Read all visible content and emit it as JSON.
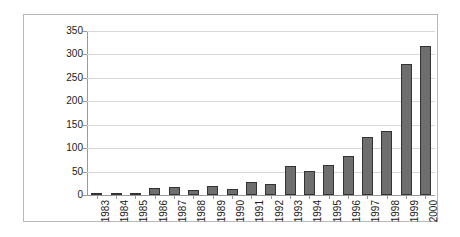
{
  "chart_data": {
    "type": "bar",
    "title": "",
    "subtitle": "",
    "xlabel": "",
    "ylabel": "",
    "categories": [
      "1983",
      "1984",
      "1985",
      "1986",
      "1987",
      "1988",
      "1989",
      "1990",
      "1991",
      "1992",
      "1993",
      "1994",
      "1995",
      "1996",
      "1997",
      "1998",
      "1999",
      "2000"
    ],
    "values": [
      1,
      2,
      4,
      16,
      18,
      10,
      20,
      12,
      27,
      24,
      62,
      52,
      63,
      84,
      124,
      137,
      280,
      317
    ],
    "series": [
      {
        "name": "",
        "values": [
          1,
          2,
          4,
          16,
          18,
          10,
          20,
          12,
          27,
          24,
          62,
          52,
          63,
          84,
          124,
          137,
          280,
          317
        ]
      }
    ],
    "ylim": [
      0,
      350
    ],
    "y_ticks": [
      0,
      50,
      100,
      150,
      200,
      250,
      300,
      350
    ],
    "y_tick_labels": [
      "0",
      "50",
      "100",
      "150",
      "200",
      "250",
      "300",
      "350"
    ],
    "grid": true,
    "grid_axis": "y",
    "legend": false,
    "legend_position": "none",
    "x_tick_rotation": 90,
    "bar_color": "#6e6e6e",
    "bar_border_color": "#333333",
    "grid_color": "#d8d8d8",
    "axis_color": "#9a9a9a",
    "frame_color": "#b9b9b9",
    "background_color": "#ffffff",
    "annotations": []
  }
}
